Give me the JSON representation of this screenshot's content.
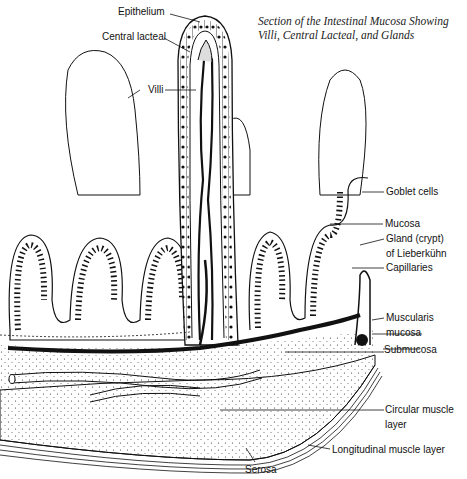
{
  "title": {
    "line1": "Section of the Intestinal Mucosa Showing",
    "line2": "Villi, Central Lacteal, and Glands"
  },
  "labels": {
    "epithelium": "Epithelium",
    "central_lacteal": "Central lacteal",
    "villi": "Villi",
    "goblet_cells": "Goblet cells",
    "mucosa": "Mucosa",
    "gland_line1": "Gland (crypt)",
    "gland_line2": "of Lieberkühn",
    "capillaries": "Capillaries",
    "muscularis_line1": "Muscularis",
    "muscularis_line2": "mucosa",
    "submucosa": "Submucosa",
    "circular_line1": "Circular muscle",
    "circular_line2": "layer",
    "longitudinal": "Longitudinal muscle layer",
    "serosa": "Serosa"
  },
  "colors": {
    "ink": "#111111",
    "paper": "#ffffff"
  }
}
